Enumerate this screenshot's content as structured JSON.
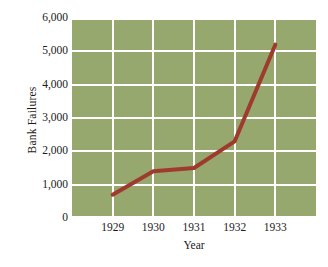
{
  "chart_data": {
    "type": "line",
    "title": "",
    "xlabel": "Year",
    "ylabel": "Bank Failures",
    "x": [
      1929,
      1930,
      1931,
      1932,
      1933
    ],
    "x_tick_labels": [
      "1929",
      "1930",
      "1931",
      "1932",
      "1933"
    ],
    "values": [
      700,
      1400,
      1500,
      2300,
      5200
    ],
    "series": [
      {
        "name": "Bank Failures",
        "values": [
          700,
          1400,
          1500,
          2300,
          5200
        ]
      }
    ],
    "ylim": [
      0,
      6000
    ],
    "y_ticks": [
      0,
      1000,
      2000,
      3000,
      4000,
      5000,
      6000
    ],
    "y_tick_labels": [
      "0",
      "1,000",
      "2,000",
      "3,000",
      "4,000",
      "5,000",
      "6,000"
    ],
    "grid": true,
    "legend": "none",
    "colors": {
      "plot_background": "#97a86f",
      "gridline": "#ffffff",
      "line": "#9e3b2e",
      "text": "#1a1a1a",
      "figure_background": "#ffffff"
    },
    "line_width_px": 4
  }
}
